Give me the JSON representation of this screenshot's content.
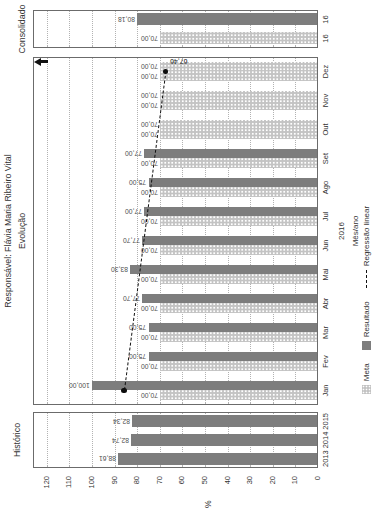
{
  "titles": {
    "responsavel": "Responsável: Flávia Maria Ribeiro Vital",
    "evolucao": "Evolução",
    "historico": "Histórico",
    "consolidado": "Consolidado"
  },
  "value_axis": {
    "title": "%",
    "min": 0,
    "max": 120,
    "step": 10
  },
  "legend": [
    {
      "label": "Meta",
      "swatch": "light"
    },
    {
      "label": "Resultado",
      "swatch": "dark"
    },
    {
      "label": "Regressão linear",
      "swatch": "dashed-line"
    }
  ],
  "colors": {
    "meta_bar": "#c3c3c3",
    "resultado_bar": "#7d7d7d",
    "trend_line": "#111111",
    "grid_line": "#b2b2b2",
    "frame": "#6b6b6b"
  },
  "chart_data": {
    "type": "bar",
    "value_unit": "%",
    "axis_range": [
      0,
      120
    ],
    "grid": "dotted every 10",
    "panels": [
      {
        "id": "historico",
        "title": "Histórico",
        "categories": [
          "2013",
          "2014",
          "2015"
        ],
        "series": [
          {
            "name": "Resultado",
            "style": "dark",
            "values": [
              88.61,
              82.74,
              82.34
            ],
            "labels": [
              "88,61",
              "82,74",
              "82,34"
            ]
          }
        ]
      },
      {
        "id": "evolucao",
        "title": "Evolução",
        "categories": [
          "Jan",
          "Fev",
          "Mar",
          "Abr",
          "Mai",
          "Jun",
          "Jul",
          "Ago",
          "Set",
          "Out",
          "Nov",
          "Dez"
        ],
        "xlabel_lines": [
          "2016",
          "Mês/ano"
        ],
        "series": [
          {
            "name": "Meta",
            "style": "light",
            "values": [
              70,
              70,
              70,
              70,
              70,
              70,
              70,
              70,
              70,
              70,
              70,
              70
            ],
            "labels": [
              "70,00",
              "70,00",
              "70,00",
              "70,00",
              "70,00",
              "70,00",
              "70,00",
              "70,00",
              "70,00",
              "70,00",
              "70,00",
              "70,00"
            ]
          },
          {
            "name": "Resultado",
            "style": "dark",
            "light_value_indexes": [
              9,
              10,
              11
            ],
            "values": [
              100,
              75,
              75,
              77.7,
              83.3,
              77.7,
              77,
              75,
              77,
              70,
              70,
              70
            ],
            "labels": [
              "100,00",
              "75,00",
              "75,00",
              "77,70",
              "83,30",
              "77,70",
              "77,00",
              "75,00",
              "77,00",
              "70,00",
              "70,00",
              "70,00"
            ]
          }
        ],
        "trend": {
          "name": "Regressão linear",
          "start_value": 85.8,
          "end_value": 67.46,
          "end_label": "67,46"
        }
      },
      {
        "id": "consolidado",
        "title": "Consolidado",
        "categories": [
          "16",
          "16"
        ],
        "bars": [
          {
            "series": "Meta",
            "style": "light",
            "value": 70,
            "label": "70,00"
          },
          {
            "series": "Resultado",
            "style": "dark",
            "value": 80.18,
            "label": "80,18"
          }
        ]
      }
    ]
  }
}
